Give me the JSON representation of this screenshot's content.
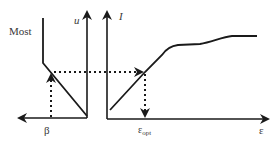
{
  "diagram": {
    "colors": {
      "line": "#1a1a1a",
      "text": "#3a3a3a",
      "background": "#ffffff"
    },
    "left_panel": {
      "top_label": "Most",
      "vertical_axis_label": "u",
      "horizontal_axis_label": "β",
      "horizontal_axis_direction": "leftward"
    },
    "right_panel": {
      "vertical_axis_label": "I",
      "horizontal_axis_label": "ε",
      "marker_label_main": "ε",
      "marker_label_sub": "opt"
    },
    "connectors": [
      {
        "from": "β on left axis",
        "to": "u-β curve",
        "style": "dotted",
        "direction": "up"
      },
      {
        "from": "u-β curve",
        "to": "I-ε curve",
        "style": "dotted",
        "direction": "right"
      },
      {
        "from": "I-ε curve",
        "to": "ε_opt on ε axis",
        "style": "dotted",
        "direction": "down"
      }
    ]
  }
}
